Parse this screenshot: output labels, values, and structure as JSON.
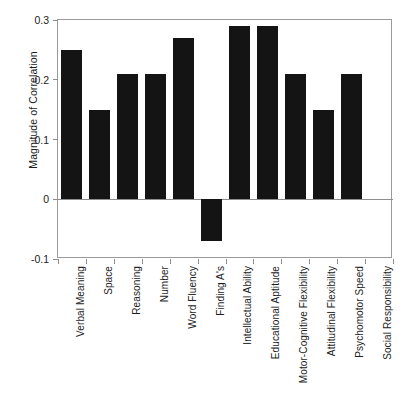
{
  "figure": {
    "background_color": "#ffffff",
    "bar_color": "#141414",
    "axis_color": "#8e8e8e"
  },
  "chart_data": {
    "type": "bar",
    "title": "",
    "subtitle": "",
    "xlabel": "",
    "ylabel": "Magnitude of Correlation",
    "ylim": [
      -0.1,
      0.3
    ],
    "yticks": [
      0.3,
      0.2,
      0.1,
      0,
      -0.1
    ],
    "ytick_labels": [
      "0.3",
      "0.2",
      "0.1",
      "0",
      "-0.1"
    ],
    "grid": false,
    "legend": null,
    "legend_position": "none",
    "orientation": "vertical",
    "categories": [
      "Verbal Meaning",
      "Space",
      "Reasoning",
      "Number",
      "Word Fluency",
      "Finding A's",
      "Intellectual Ability",
      "Educational Aptitude",
      "Motor-Cognitive Flexibility",
      "Attitudinal Flexibility",
      "Psychomotor Speed",
      "Social Responsibility"
    ],
    "values": [
      0.25,
      0.15,
      0.21,
      0.21,
      0.27,
      -0.07,
      0.29,
      0.29,
      0.21,
      0.15,
      0.21,
      0.0
    ],
    "annotations": []
  }
}
